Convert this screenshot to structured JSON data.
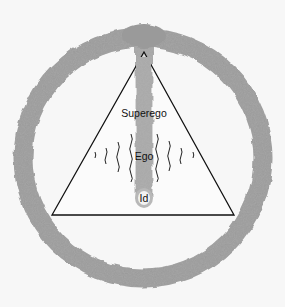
{
  "diagram": {
    "type": "psyche-structure",
    "labels": {
      "superego": "Superego",
      "ego": "Ego",
      "id": "Id"
    },
    "colors": {
      "background": "#f7f7f7",
      "ring": "#9a9a9a",
      "column": "#a5a5a5",
      "triangle_stroke": "#111111",
      "triangle_fill": "#ffffff",
      "wave_stroke": "#222222"
    },
    "wave_count_per_side": 4
  }
}
